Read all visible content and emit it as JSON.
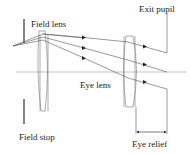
{
  "diagram": {
    "labels": {
      "field_lens": "Field lens",
      "exit_pupil": "Exit pupil",
      "eye_lens": "Eye lens",
      "field_stop": "Field stop",
      "eye_relief": "Eye relief"
    },
    "colors": {
      "line": "#555555",
      "lens": "#777777",
      "axis": "#aaaaaa",
      "text": "#222222"
    }
  }
}
